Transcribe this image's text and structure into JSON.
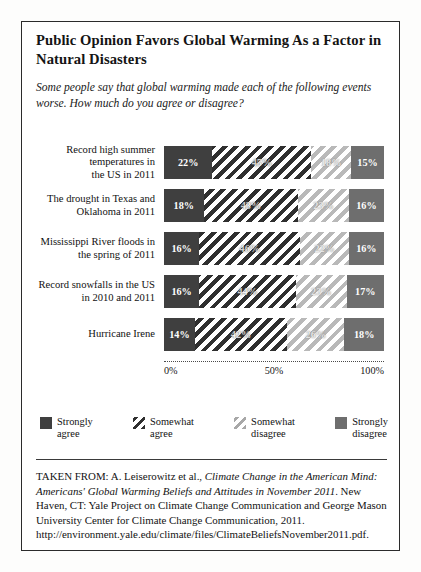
{
  "title": "Public Opinion Favors Global Warming As a Factor in Natural Disasters",
  "subtitle": "Some people say that global warming made each of the following events worse. How much do you agree or disagree?",
  "axis": {
    "tick_0": "0%",
    "tick_50": "50%",
    "tick_100": "100%"
  },
  "legend": [
    {
      "label": "Strongly\nagree",
      "key": "sa",
      "color": "#3f3f3f"
    },
    {
      "label": "Somewhat\nagree",
      "key": "swa",
      "color": "#2f2f2f"
    },
    {
      "label": "Somewhat\ndisagree",
      "key": "swd",
      "color": "#b9b9b9"
    },
    {
      "label": "Strongly\ndisagree",
      "key": "sd",
      "color": "#6e6e6e"
    }
  ],
  "source": {
    "prefix": "TAKEN FROM: A. Leiserowitz et al., ",
    "italic": "Climate Change in the American Mind: Americans' Global Warming Beliefs and Attitudes in November 2011",
    "suffix": ". New Haven, CT: Yale Project on Climate Change Communication and George Mason University Center for Climate Change Communication, 2011. http://environment.yale.edu/climate/files/ClimateBeliefsNovember2011.pdf."
  },
  "chart_data": {
    "type": "bar",
    "title": "Public Opinion Favors Global Warming As a Factor in Natural Disasters",
    "subtitle": "Some people say that global warming made each of the following events worse. How much do you agree or disagree?",
    "orientation": "horizontal",
    "stacked": true,
    "xlabel": "",
    "ylabel": "",
    "xlim": [
      0,
      100
    ],
    "xticks": [
      0,
      50,
      100
    ],
    "xticklabels": [
      "0%",
      "50%",
      "100%"
    ],
    "grid": false,
    "legend_position": "bottom",
    "categories": [
      "Record high summer temperatures in the US in 2011",
      "The drought in Texas and Oklahoma in 2011",
      "Mississippi River floods in the spring of 2011",
      "Record snowfalls in the US in 2010 and 2011",
      "Hurricane Irene"
    ],
    "series": [
      {
        "name": "Strongly agree",
        "values": [
          22,
          18,
          16,
          16,
          14
        ]
      },
      {
        "name": "Somewhat agree",
        "values": [
          45,
          43,
          46,
          44,
          42
        ]
      },
      {
        "name": "Somewhat disagree",
        "values": [
          18,
          23,
          22,
          23,
          26
        ]
      },
      {
        "name": "Strongly disagree",
        "values": [
          15,
          16,
          16,
          17,
          18
        ]
      }
    ],
    "rows": [
      {
        "label_line1": "Record high summer",
        "label_line2": "temperatures in",
        "label_line3": "the US in 2011",
        "segments": [
          {
            "key": "sa",
            "value": 22,
            "label": "22%"
          },
          {
            "key": "swa",
            "value": 45,
            "label": "45%"
          },
          {
            "key": "swd",
            "value": 18,
            "label": "18%"
          },
          {
            "key": "sd",
            "value": 15,
            "label": "15%"
          }
        ]
      },
      {
        "label_line1": "The drought in Texas and",
        "label_line2": "Oklahoma in 2011",
        "label_line3": "",
        "segments": [
          {
            "key": "sa",
            "value": 18,
            "label": "18%"
          },
          {
            "key": "swa",
            "value": 43,
            "label": "43%"
          },
          {
            "key": "swd",
            "value": 23,
            "label": "23%"
          },
          {
            "key": "sd",
            "value": 16,
            "label": "16%"
          }
        ]
      },
      {
        "label_line1": "Mississippi River floods in",
        "label_line2": "the spring of 2011",
        "label_line3": "",
        "segments": [
          {
            "key": "sa",
            "value": 16,
            "label": "16%"
          },
          {
            "key": "swa",
            "value": 46,
            "label": "46%"
          },
          {
            "key": "swd",
            "value": 22,
            "label": "22%"
          },
          {
            "key": "sd",
            "value": 16,
            "label": "16%"
          }
        ]
      },
      {
        "label_line1": "Record snowfalls in the US",
        "label_line2": "in 2010 and 2011",
        "label_line3": "",
        "segments": [
          {
            "key": "sa",
            "value": 16,
            "label": "16%"
          },
          {
            "key": "swa",
            "value": 44,
            "label": "44%"
          },
          {
            "key": "swd",
            "value": 23,
            "label": "23%"
          },
          {
            "key": "sd",
            "value": 17,
            "label": "17%"
          }
        ]
      },
      {
        "label_line1": "Hurricane Irene",
        "label_line2": "",
        "label_line3": "",
        "segments": [
          {
            "key": "sa",
            "value": 14,
            "label": "14%"
          },
          {
            "key": "swa",
            "value": 42,
            "label": "42%"
          },
          {
            "key": "swd",
            "value": 26,
            "label": "26%"
          },
          {
            "key": "sd",
            "value": 18,
            "label": "18%"
          }
        ]
      }
    ]
  }
}
